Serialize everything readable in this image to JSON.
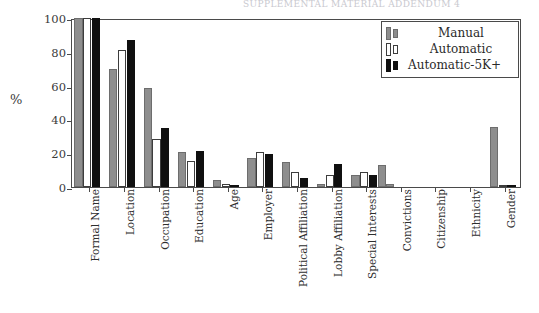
{
  "figure": {
    "top_clipped_text": "SUPPLEMENTAL MATERIAL ADDENDUM 4",
    "background": "#ffffff"
  },
  "chart_data": {
    "type": "bar",
    "title": "",
    "subtitle": "",
    "xlabel": "",
    "ylabel": "%",
    "ylim": [
      0,
      100
    ],
    "yticks": [
      0,
      20,
      40,
      60,
      80,
      100
    ],
    "grid": false,
    "legend_position": "top-right",
    "categories": [
      "Formal Name",
      "Location",
      "Occupation",
      "Education",
      "Age",
      "Employer",
      "Political Affiliation",
      "Lobby Affiliation",
      "Special Interests",
      "Convictions",
      "Citizenship",
      "Ethnicity",
      "Gender"
    ],
    "series": [
      {
        "name": "Manual",
        "color": "#8e8e8e",
        "values": [
          100,
          69.8,
          58.4,
          20.9,
          3.9,
          16.9,
          15.0,
          1.6,
          7.1,
          1.5,
          0,
          0,
          35.5
        ]
      },
      {
        "name": "Automatic",
        "color": "#ffffff",
        "values": [
          100,
          80.9,
          28.2,
          15.1,
          1.6,
          20.7,
          9.1,
          6.9,
          8.8,
          0,
          0,
          0,
          1.2
        ]
      },
      {
        "name": "Automatic-5K+",
        "color": "#101010",
        "values": [
          100,
          87.2,
          34.7,
          21.4,
          0.3,
          19.4,
          5.5,
          13.9,
          6.9,
          0,
          0,
          0,
          0.3
        ]
      }
    ],
    "extra_bars": [
      {
        "category": "Special Interests",
        "series": "Manual",
        "note": "trailing gray bar",
        "value": 13.1
      }
    ]
  },
  "legend": {
    "entries": [
      {
        "label": "Manual",
        "swatch": "gray"
      },
      {
        "label": "Automatic",
        "swatch": "white"
      },
      {
        "label": "Automatic-5K+",
        "swatch": "black"
      }
    ]
  }
}
